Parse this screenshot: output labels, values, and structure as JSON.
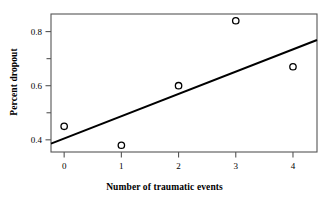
{
  "chart_data": {
    "type": "scatter",
    "title": "",
    "xlabel": "Number of traumatic events",
    "ylabel": "Percent dropout",
    "x": [
      0,
      1,
      2,
      3,
      4
    ],
    "values": [
      0.45,
      0.38,
      0.6,
      0.84,
      0.67
    ],
    "series": [
      {
        "name": "Percent dropout",
        "marker": "open-circle",
        "points": [
          {
            "x": 0,
            "y": 0.45
          },
          {
            "x": 1,
            "y": 0.38
          },
          {
            "x": 2,
            "y": 0.6
          },
          {
            "x": 3,
            "y": 0.84
          },
          {
            "x": 4,
            "y": 0.67
          }
        ]
      },
      {
        "name": "regression line",
        "type": "line",
        "points": [
          {
            "x": -0.23,
            "y": 0.386
          },
          {
            "x": 4.42,
            "y": 0.769
          }
        ]
      }
    ],
    "xlim": [
      -0.23,
      4.42
    ],
    "ylim": [
      0.355,
      0.865
    ],
    "xticks": [
      0,
      1,
      2,
      3,
      4
    ],
    "xtick_labels": [
      "0",
      "1",
      "2",
      "3",
      "4"
    ],
    "yticks": [
      0.4,
      0.5,
      0.6,
      0.7,
      0.8
    ],
    "ytick_labels": [
      "0.4",
      "",
      "0.6",
      "",
      "0.8"
    ],
    "grid": false,
    "legend": "none",
    "line_color": "#000000",
    "marker_edge_color": "#000000",
    "marker_face_color": "#ffffff",
    "axis_color": "#555555",
    "background_color": "#ffffff"
  },
  "axes": {
    "x_title": "Number of traumatic events",
    "y_title": "Percent dropout"
  }
}
